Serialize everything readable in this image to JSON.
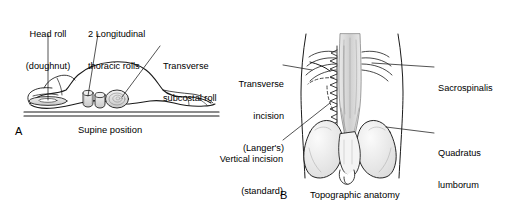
{
  "figure": {
    "background_color": "#ffffff",
    "ink_color": "#1a1a1a",
    "shading_color": "#d8d8d8"
  },
  "panel_a": {
    "letter": "A",
    "caption": "Supine position",
    "labels": {
      "head_roll_line1": "Head roll",
      "head_roll_line2": "(doughnut)",
      "thoracic_rolls_line1": "2 Longitudinal",
      "thoracic_rolls_line2": "thoracic rolls",
      "subcostal_roll_line1": "Transverse",
      "subcostal_roll_line2": "subcostal roll"
    }
  },
  "panel_b": {
    "letter": "B",
    "caption": "Topographic anatomy",
    "labels": {
      "transverse_incision_line1": "Transverse",
      "transverse_incision_line2": "incision",
      "transverse_incision_line3": "(Langer's)",
      "vertical_incision_line1": "Vertical incision",
      "vertical_incision_line2": "(standard)",
      "sacrospinalis": "Sacrospinalis",
      "quadratus_line1": "Quadratus",
      "quadratus_line2": "lumborum"
    }
  }
}
